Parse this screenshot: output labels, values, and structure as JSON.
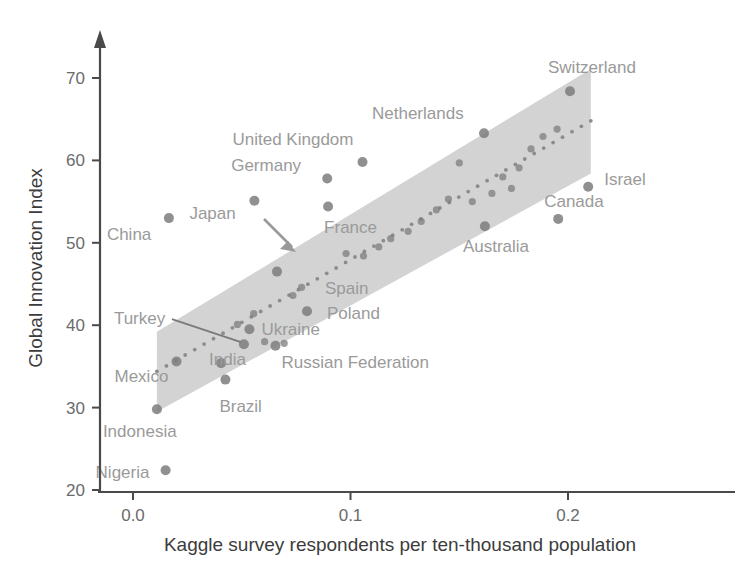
{
  "chart_data": {
    "type": "scatter",
    "title": "",
    "xlabel": "Kaggle survey respondents per ten-thousand population",
    "ylabel": "Global Innovation Index",
    "xlim": [
      -0.012,
      0.225
    ],
    "ylim": [
      20,
      75
    ],
    "xticks": [
      0.0,
      0.1,
      0.2
    ],
    "xticklabels": [
      "0.0",
      "0.1",
      "0.2"
    ],
    "yticks": [
      20,
      30,
      40,
      50,
      60,
      70
    ],
    "yticklabels": [
      "20",
      "30",
      "40",
      "50",
      "60",
      "70"
    ],
    "grid": false,
    "legend": null,
    "annotations": [
      {
        "name": "germany-callout-arrow",
        "note": "arrow from Germany label pointing down-right into the band"
      },
      {
        "name": "turkey-leader-line",
        "note": "leader line from Turkey label to its point"
      }
    ],
    "regression_band": {
      "name": "confidence-interval-band",
      "color": "#cfcfcf",
      "x_start": 0.011,
      "x_end": 0.2105,
      "y_lower_start": 29.5,
      "y_upper_start": 39.2,
      "y_lower_end": 58.4,
      "y_upper_end": 71.1
    },
    "fit_line": {
      "name": "regression-fit-dotted-line",
      "style": "dotted",
      "x_start": 0.011,
      "x_end": 0.2105,
      "y_start": 34.4,
      "y_end": 64.8
    },
    "labeled_points": [
      {
        "label": "China",
        "x": 0.0165,
        "y": 53.0,
        "label_dx": -62,
        "label_dy": 22,
        "anchor": "start"
      },
      {
        "label": "Japan",
        "x": 0.0558,
        "y": 55.1,
        "label_dx": -65,
        "label_dy": 18,
        "anchor": "start"
      },
      {
        "label": "Germany",
        "x": 0.0893,
        "y": 57.8,
        "label_dx": -96,
        "label_dy": -8,
        "anchor": "start"
      },
      {
        "label": "United Kingdom",
        "x": 0.1055,
        "y": 59.8,
        "label_dx": -130,
        "label_dy": -17,
        "anchor": "start"
      },
      {
        "label": "France",
        "x": 0.0897,
        "y": 54.4,
        "label_dx": -4,
        "label_dy": 26,
        "anchor": "start"
      },
      {
        "label": "Spain",
        "x": 0.0662,
        "y": 46.5,
        "label_dx": 48,
        "label_dy": 22,
        "anchor": "start"
      },
      {
        "label": "Poland",
        "x": 0.08,
        "y": 41.7,
        "label_dx": 20,
        "label_dy": 8,
        "anchor": "start"
      },
      {
        "label": "Ukraine",
        "x": 0.0535,
        "y": 39.5,
        "label_dx": 12,
        "label_dy": 6,
        "anchor": "start"
      },
      {
        "label": "Russian Federation",
        "x": 0.0655,
        "y": 37.5,
        "label_dx": 6,
        "label_dy": 22,
        "anchor": "start"
      },
      {
        "label": "Turkey",
        "x": 0.051,
        "y": 37.7,
        "label_dx": -130,
        "label_dy": -20,
        "anchor": "start"
      },
      {
        "label": "India",
        "x": 0.0405,
        "y": 35.4,
        "label_dx": -12,
        "label_dy": 2,
        "anchor": "start"
      },
      {
        "label": "Brazil",
        "x": 0.0425,
        "y": 33.4,
        "label_dx": -6,
        "label_dy": 32,
        "anchor": "start"
      },
      {
        "label": "Mexico",
        "x": 0.02,
        "y": 35.6,
        "label_dx": -62,
        "label_dy": 20,
        "anchor": "start"
      },
      {
        "label": "Indonesia",
        "x": 0.011,
        "y": 29.8,
        "label_dx": -54,
        "label_dy": 28,
        "anchor": "start"
      },
      {
        "label": "Nigeria",
        "x": 0.015,
        "y": 22.4,
        "label_dx": -70,
        "label_dy": 8,
        "anchor": "start"
      },
      {
        "label": "Australia",
        "x": 0.1618,
        "y": 52.0,
        "label_dx": -22,
        "label_dy": 26,
        "anchor": "start"
      },
      {
        "label": "Canada",
        "x": 0.1955,
        "y": 52.9,
        "label_dx": -14,
        "label_dy": -12,
        "anchor": "start"
      },
      {
        "label": "Israel",
        "x": 0.2093,
        "y": 56.8,
        "label_dx": 16,
        "label_dy": -2,
        "anchor": "start"
      },
      {
        "label": "Netherlands",
        "x": 0.1614,
        "y": 63.3,
        "label_dx": -112,
        "label_dy": -14,
        "anchor": "start"
      },
      {
        "label": "Switzerland",
        "x": 0.2009,
        "y": 68.4,
        "label_dx": -22,
        "label_dy": -18,
        "anchor": "start"
      }
    ],
    "unlabeled_points": [
      {
        "x": 0.0605,
        "y": 38.0
      },
      {
        "x": 0.0695,
        "y": 37.8
      },
      {
        "x": 0.048,
        "y": 40.1
      },
      {
        "x": 0.0555,
        "y": 41.4
      },
      {
        "x": 0.0735,
        "y": 43.6
      },
      {
        "x": 0.0775,
        "y": 44.6
      },
      {
        "x": 0.098,
        "y": 48.7
      },
      {
        "x": 0.106,
        "y": 48.4
      },
      {
        "x": 0.113,
        "y": 49.5
      },
      {
        "x": 0.1185,
        "y": 50.5
      },
      {
        "x": 0.1265,
        "y": 51.4
      },
      {
        "x": 0.1325,
        "y": 52.6
      },
      {
        "x": 0.1395,
        "y": 54.0
      },
      {
        "x": 0.145,
        "y": 55.3
      },
      {
        "x": 0.15,
        "y": 59.7
      },
      {
        "x": 0.17,
        "y": 58.0
      },
      {
        "x": 0.1775,
        "y": 59.1
      },
      {
        "x": 0.183,
        "y": 61.4
      },
      {
        "x": 0.1885,
        "y": 62.9
      },
      {
        "x": 0.195,
        "y": 63.8
      },
      {
        "x": 0.174,
        "y": 56.6
      },
      {
        "x": 0.165,
        "y": 56.0
      },
      {
        "x": 0.156,
        "y": 55.0
      }
    ]
  },
  "axes": {
    "y_title": "Global Innovation Index",
    "x_title": "Kaggle survey respondents per ten-thousand population"
  }
}
